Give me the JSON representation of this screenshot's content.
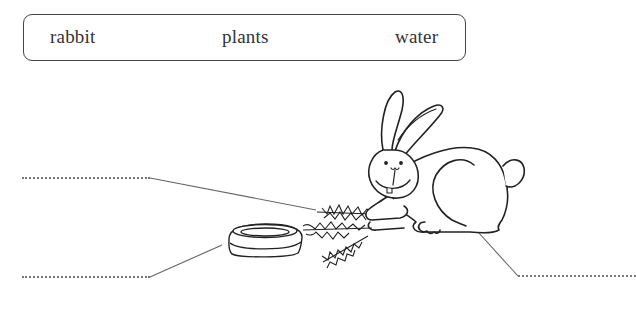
{
  "worksheet": {
    "word_bank": {
      "words": [
        "rabbit",
        "plants",
        "water"
      ]
    },
    "illustration": {
      "subjects": [
        "rabbit",
        "plants",
        "water bowl"
      ]
    },
    "answer_blanks": [
      {
        "id": "blank-1",
        "points_to": "plants",
        "value": ""
      },
      {
        "id": "blank-2",
        "points_to": "water bowl",
        "value": ""
      },
      {
        "id": "blank-3",
        "points_to": "rabbit",
        "value": ""
      }
    ],
    "colors": {
      "outline": "#222222",
      "leader_line": "#666666",
      "dotted_line": "#777777",
      "background": "#ffffff"
    }
  }
}
